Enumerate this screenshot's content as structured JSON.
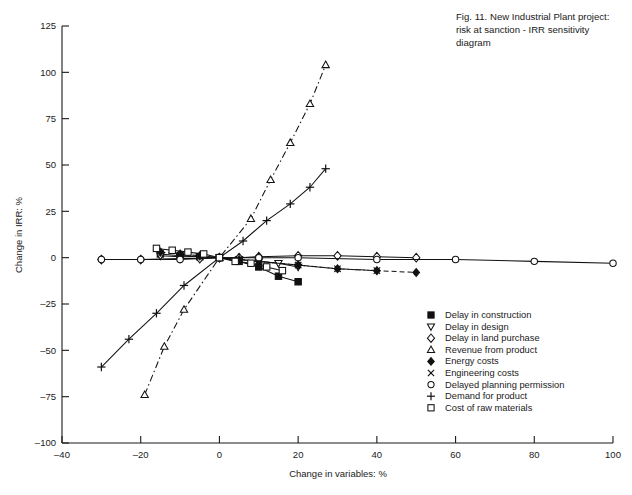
{
  "caption": {
    "line1": "Fig. 11. New Industrial Plant project:",
    "line2": "risk at sanction - IRR sensitivity",
    "line3": "diagram"
  },
  "chart_data": {
    "type": "line",
    "title": "Fig. 11. New Industrial Plant project: risk at sanction - IRR sensitivity diagram",
    "xlabel": "Change in variables: %",
    "ylabel": "Change in IRR: %",
    "xlim": [
      -40,
      100
    ],
    "ylim": [
      -100,
      125
    ],
    "xticks": [
      -40,
      -20,
      0,
      20,
      40,
      60,
      80,
      100
    ],
    "xtick_labels": [
      "–40",
      "–20",
      "0",
      "20",
      "40",
      "60",
      "80",
      "100"
    ],
    "yticks": [
      -100,
      -75,
      -50,
      -25,
      0,
      25,
      50,
      75,
      100,
      125
    ],
    "ytick_labels": [
      "–100",
      "–75",
      "–50",
      "–25",
      "0",
      "25",
      "50",
      "75",
      "100",
      "125"
    ],
    "grid": false,
    "legend_position": "lower-right",
    "series": [
      {
        "name": "Delay in construction",
        "marker": "filled-square",
        "line": "solid",
        "x": [
          -15,
          -10,
          -5,
          0,
          5,
          10,
          15,
          20
        ],
        "y": [
          2,
          1,
          0.5,
          0,
          -2,
          -5,
          -10,
          -13
        ]
      },
      {
        "name": "Delay in design",
        "marker": "down-triangle",
        "line": "solid",
        "x": [
          -15,
          -10,
          -5,
          0,
          5,
          10,
          15,
          20
        ],
        "y": [
          1,
          0.5,
          0.5,
          0,
          -1,
          -2,
          -3,
          -5
        ]
      },
      {
        "name": "Delay in land purchase",
        "marker": "diamond",
        "line": "solid",
        "x": [
          -30,
          -20,
          -10,
          -5,
          0,
          5,
          10,
          20,
          30,
          40,
          50
        ],
        "y": [
          -1,
          -1,
          -0.5,
          -0.5,
          0,
          0,
          0.5,
          1,
          1,
          0.5,
          0
        ]
      },
      {
        "name": "Revenue from product",
        "marker": "up-triangle",
        "line": "dash-dot",
        "x": [
          -19,
          -14,
          -9,
          0,
          8,
          13,
          18,
          23,
          27
        ],
        "y": [
          -74,
          -48,
          -28,
          0,
          21,
          42,
          62,
          83,
          104
        ]
      },
      {
        "name": "Energy costs",
        "marker": "filled-diamond",
        "line": "dashed",
        "x": [
          -15,
          -10,
          -5,
          0,
          5,
          10,
          20,
          30,
          40,
          50
        ],
        "y": [
          3,
          2,
          1,
          0,
          -1,
          -2,
          -4,
          -6,
          -7,
          -8
        ]
      },
      {
        "name": "Engineering costs",
        "marker": "cross-x",
        "line": "dashed",
        "x": [
          -10,
          -5,
          0,
          5,
          10,
          20,
          30,
          40
        ],
        "y": [
          1,
          0.5,
          0,
          -1,
          -2,
          -4,
          -6,
          -7
        ]
      },
      {
        "name": "Delayed planning permission",
        "marker": "circle",
        "line": "solid",
        "x": [
          -30,
          -20,
          -10,
          0,
          10,
          20,
          40,
          60,
          80,
          100
        ],
        "y": [
          -1,
          -1,
          -1,
          0,
          0,
          0,
          -1,
          -1,
          -2,
          -3
        ]
      },
      {
        "name": "Demand for product",
        "marker": "plus",
        "line": "solid",
        "x": [
          -30,
          -23,
          -16,
          -9,
          0,
          6,
          12,
          18,
          23,
          27
        ],
        "y": [
          -59,
          -44,
          -30,
          -15,
          0,
          9,
          20,
          29,
          38,
          48
        ]
      },
      {
        "name": "Cost of raw materials",
        "marker": "open-square",
        "line": "solid",
        "x": [
          -16,
          -12,
          -8,
          -4,
          0,
          4,
          8,
          12,
          16
        ],
        "y": [
          5,
          4,
          3,
          2,
          0,
          -2,
          -3,
          -5,
          -7
        ]
      }
    ]
  },
  "legend": {
    "items": [
      {
        "marker": "filled-square",
        "label": "Delay in construction"
      },
      {
        "marker": "down-triangle",
        "label": "Delay in design"
      },
      {
        "marker": "diamond",
        "label": "Delay in land purchase"
      },
      {
        "marker": "up-triangle",
        "label": "Revenue from product"
      },
      {
        "marker": "filled-diamond",
        "label": "Energy costs"
      },
      {
        "marker": "cross-x",
        "label": "Engineering costs"
      },
      {
        "marker": "circle",
        "label": "Delayed planning permission"
      },
      {
        "marker": "plus",
        "label": "Demand for product"
      },
      {
        "marker": "open-square",
        "label": "Cost of raw materials"
      }
    ]
  }
}
